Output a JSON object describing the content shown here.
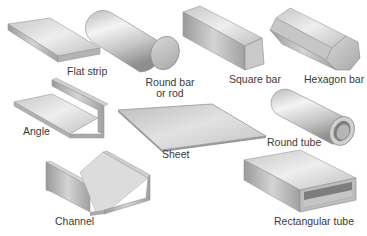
{
  "figure": {
    "background": "#ffffff",
    "metal_light": "#e6e6e6",
    "metal_mid": "#bdbdbd",
    "metal_dark": "#8c8c8c",
    "label_color": "#3a3a3a"
  },
  "shapes": [
    {
      "id": "flat-strip",
      "label": "Flat strip"
    },
    {
      "id": "round-bar",
      "label_line1": "Round bar",
      "label_line2": "or rod"
    },
    {
      "id": "square-bar",
      "label": "Square bar"
    },
    {
      "id": "hexagon-bar",
      "label": "Hexagon bar"
    },
    {
      "id": "angle",
      "label": "Angle"
    },
    {
      "id": "sheet",
      "label": "Sheet"
    },
    {
      "id": "round-tube",
      "label": "Round tube"
    },
    {
      "id": "channel",
      "label": "Channel"
    },
    {
      "id": "rectangular-tube",
      "label": "Rectangular tube"
    }
  ]
}
